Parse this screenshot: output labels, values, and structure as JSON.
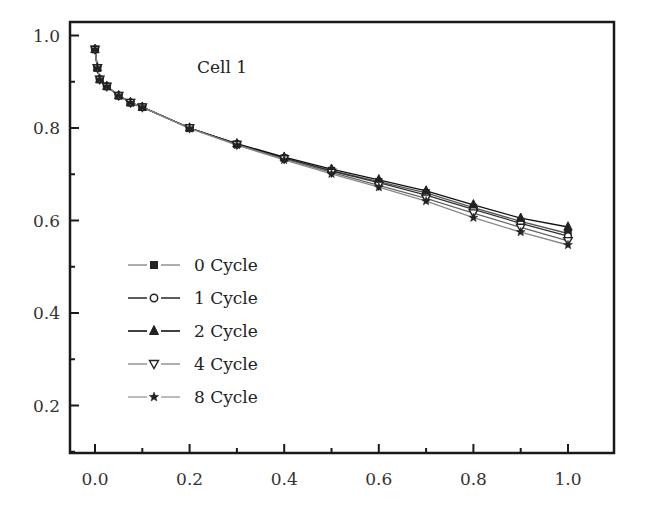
{
  "chart_data": {
    "type": "line",
    "title": "",
    "annotation": "Cell 1",
    "xlabel": "",
    "ylabel": "",
    "xlim": [
      -0.05,
      1.1
    ],
    "ylim": [
      0.1,
      1.02
    ],
    "grid": false,
    "legend_position": "lower-left inside",
    "x_ticks": [
      "0.0",
      "0.2",
      "0.4",
      "0.6",
      "0.8",
      "1.0"
    ],
    "y_ticks": [
      "0.2",
      "0.4",
      "0.6",
      "0.8",
      "1.0"
    ],
    "x": [
      0.0,
      0.005,
      0.01,
      0.025,
      0.05,
      0.075,
      0.1,
      0.2,
      0.3,
      0.4,
      0.5,
      0.6,
      0.7,
      0.8,
      0.9,
      1.0
    ],
    "series": [
      {
        "name": "0 Cycle",
        "marker": "square-filled",
        "values": [
          0.97,
          0.93,
          0.905,
          0.89,
          0.87,
          0.855,
          0.845,
          0.8,
          0.765,
          0.735,
          0.708,
          0.684,
          0.66,
          0.628,
          0.598,
          0.572
        ]
      },
      {
        "name": "1 Cycle",
        "marker": "circle-open",
        "values": [
          0.97,
          0.93,
          0.905,
          0.89,
          0.87,
          0.855,
          0.845,
          0.8,
          0.765,
          0.735,
          0.707,
          0.682,
          0.655,
          0.624,
          0.594,
          0.566
        ]
      },
      {
        "name": "2 Cycle",
        "marker": "triangle-up-filled",
        "values": [
          0.97,
          0.93,
          0.905,
          0.89,
          0.87,
          0.855,
          0.845,
          0.8,
          0.766,
          0.737,
          0.711,
          0.688,
          0.664,
          0.634,
          0.605,
          0.586
        ]
      },
      {
        "name": "4 Cycle",
        "marker": "triangle-down-open",
        "values": [
          0.97,
          0.93,
          0.905,
          0.89,
          0.87,
          0.855,
          0.845,
          0.8,
          0.764,
          0.733,
          0.704,
          0.676,
          0.648,
          0.616,
          0.585,
          0.556
        ]
      },
      {
        "name": "8 Cycle",
        "marker": "star-filled",
        "values": [
          0.97,
          0.93,
          0.905,
          0.89,
          0.87,
          0.855,
          0.845,
          0.799,
          0.763,
          0.731,
          0.701,
          0.672,
          0.642,
          0.606,
          0.575,
          0.547
        ]
      }
    ]
  },
  "legend": {
    "items": [
      {
        "label": "0 Cycle",
        "marker": "square-filled"
      },
      {
        "label": "1 Cycle",
        "marker": "circle-open"
      },
      {
        "label": "2 Cycle",
        "marker": "triangle-up-filled"
      },
      {
        "label": "4 Cycle",
        "marker": "triangle-down-open"
      },
      {
        "label": "8 Cycle",
        "marker": "star-filled"
      }
    ]
  },
  "colors": {
    "axis": "#1a1a1a",
    "line": "#2a2a2a",
    "text": "#222222"
  }
}
